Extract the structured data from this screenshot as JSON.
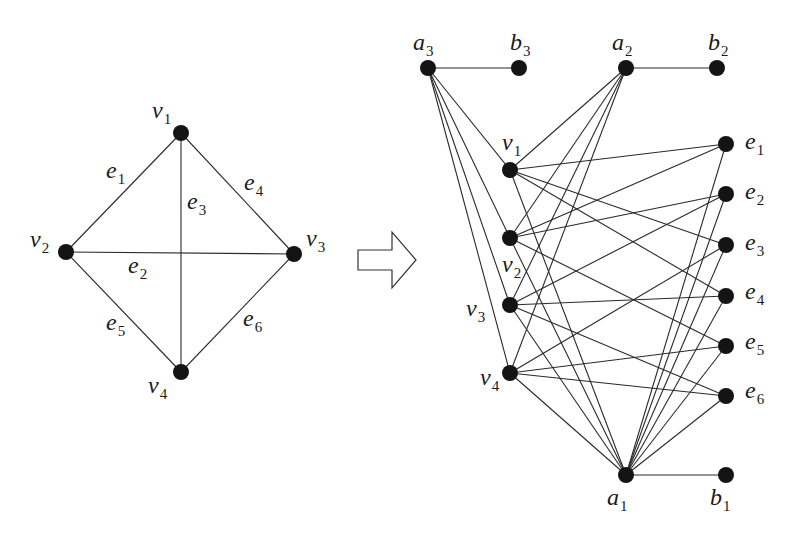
{
  "colors": {
    "node": "#141414",
    "edge": "#2a2a2a",
    "background": "#ffffff"
  },
  "left_graph": {
    "nodes": [
      {
        "id": "v1",
        "base": "v",
        "sub": "1",
        "x": 181,
        "y": 133,
        "lx": 152,
        "ly": 118
      },
      {
        "id": "v2",
        "base": "v",
        "sub": "2",
        "x": 66,
        "y": 252,
        "lx": 30,
        "ly": 247
      },
      {
        "id": "v3",
        "base": "v",
        "sub": "3",
        "x": 294,
        "y": 254,
        "lx": 306,
        "ly": 246
      },
      {
        "id": "v4",
        "base": "v",
        "sub": "4",
        "x": 181,
        "y": 372,
        "lx": 148,
        "ly": 393
      }
    ],
    "edges": [
      {
        "id": "e1",
        "from": "v1",
        "to": "v2",
        "base": "e",
        "sub": "1",
        "lx": 106,
        "ly": 178
      },
      {
        "id": "e2",
        "from": "v2",
        "to": "v3",
        "base": "e",
        "sub": "2",
        "lx": 128,
        "ly": 273
      },
      {
        "id": "e3",
        "from": "v1",
        "to": "v4",
        "base": "e",
        "sub": "3",
        "lx": 187,
        "ly": 209
      },
      {
        "id": "e4",
        "from": "v1",
        "to": "v3",
        "base": "e",
        "sub": "4",
        "lx": 244,
        "ly": 190
      },
      {
        "id": "e5",
        "from": "v2",
        "to": "v4",
        "base": "e",
        "sub": "5",
        "lx": 106,
        "ly": 330
      },
      {
        "id": "e6",
        "from": "v3",
        "to": "v4",
        "base": "e",
        "sub": "6",
        "lx": 243,
        "ly": 326
      }
    ]
  },
  "arrow": {
    "direction": "right",
    "points": "358,250 392,250 392,232 416,260 392,288 392,270 358,270"
  },
  "right_graph": {
    "nodes": [
      {
        "id": "a3",
        "base": "a",
        "sub": "3",
        "x": 428,
        "y": 68,
        "lx": 413,
        "ly": 50
      },
      {
        "id": "b3",
        "base": "b",
        "sub": "3",
        "x": 519,
        "y": 68,
        "lx": 510,
        "ly": 50
      },
      {
        "id": "a2",
        "base": "a",
        "sub": "2",
        "x": 626,
        "y": 68,
        "lx": 612,
        "ly": 50
      },
      {
        "id": "b2",
        "base": "b",
        "sub": "2",
        "x": 717,
        "y": 68,
        "lx": 708,
        "ly": 50
      },
      {
        "id": "rv1",
        "base": "v",
        "sub": "1",
        "x": 510,
        "y": 170,
        "lx": 502,
        "ly": 150
      },
      {
        "id": "rv2",
        "base": "v",
        "sub": "2",
        "x": 510,
        "y": 238,
        "lx": 502,
        "ly": 272
      },
      {
        "id": "rv3",
        "base": "v",
        "sub": "3",
        "x": 510,
        "y": 305,
        "lx": 466,
        "ly": 316
      },
      {
        "id": "rv4",
        "base": "v",
        "sub": "4",
        "x": 510,
        "y": 373,
        "lx": 480,
        "ly": 385
      },
      {
        "id": "re1",
        "base": "e",
        "sub": "1",
        "x": 726,
        "y": 144,
        "lx": 745,
        "ly": 149
      },
      {
        "id": "re2",
        "base": "e",
        "sub": "2",
        "x": 726,
        "y": 194,
        "lx": 745,
        "ly": 199
      },
      {
        "id": "re3",
        "base": "e",
        "sub": "3",
        "x": 726,
        "y": 245,
        "lx": 745,
        "ly": 250
      },
      {
        "id": "re4",
        "base": "e",
        "sub": "4",
        "x": 726,
        "y": 296,
        "lx": 745,
        "ly": 299
      },
      {
        "id": "re5",
        "base": "e",
        "sub": "5",
        "x": 726,
        "y": 346,
        "lx": 745,
        "ly": 349
      },
      {
        "id": "re6",
        "base": "e",
        "sub": "6",
        "x": 726,
        "y": 396,
        "lx": 745,
        "ly": 398
      },
      {
        "id": "a1",
        "base": "a",
        "sub": "1",
        "x": 626,
        "y": 475,
        "lx": 607,
        "ly": 505
      },
      {
        "id": "b1",
        "base": "b",
        "sub": "1",
        "x": 726,
        "y": 475,
        "lx": 710,
        "ly": 505
      }
    ],
    "edges": [
      [
        "a3",
        "b3"
      ],
      [
        "a2",
        "b2"
      ],
      [
        "a1",
        "b1"
      ],
      [
        "a3",
        "rv1"
      ],
      [
        "a3",
        "rv2"
      ],
      [
        "a3",
        "rv3"
      ],
      [
        "a3",
        "rv4"
      ],
      [
        "a2",
        "rv1"
      ],
      [
        "a2",
        "rv2"
      ],
      [
        "a2",
        "rv3"
      ],
      [
        "a2",
        "rv4"
      ],
      [
        "a1",
        "rv1"
      ],
      [
        "a1",
        "rv2"
      ],
      [
        "a1",
        "rv3"
      ],
      [
        "a1",
        "rv4"
      ],
      [
        "a1",
        "re1"
      ],
      [
        "a1",
        "re2"
      ],
      [
        "a1",
        "re3"
      ],
      [
        "a1",
        "re4"
      ],
      [
        "a1",
        "re5"
      ],
      [
        "a1",
        "re6"
      ],
      [
        "rv1",
        "re1"
      ],
      [
        "rv2",
        "re1"
      ],
      [
        "rv2",
        "re2"
      ],
      [
        "rv3",
        "re2"
      ],
      [
        "rv1",
        "re3"
      ],
      [
        "rv4",
        "re3"
      ],
      [
        "rv1",
        "re4"
      ],
      [
        "rv3",
        "re4"
      ],
      [
        "rv2",
        "re5"
      ],
      [
        "rv4",
        "re5"
      ],
      [
        "rv3",
        "re6"
      ],
      [
        "rv4",
        "re6"
      ]
    ]
  }
}
